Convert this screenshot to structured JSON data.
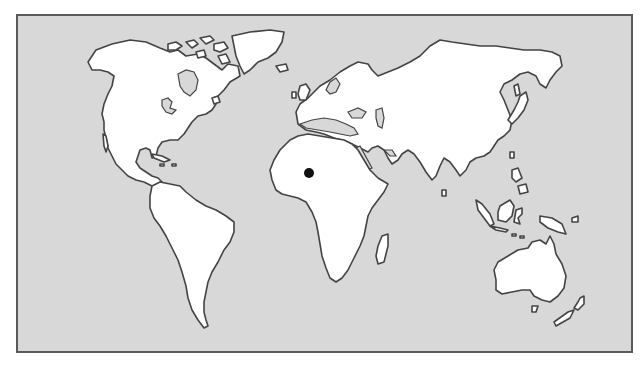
{
  "map": {
    "type": "world-outline",
    "projection": "equirectangular-like",
    "colors": {
      "ocean": "#d8d8d8",
      "land": "#ffffff",
      "coastline": "#444444",
      "frame_border": "#5a5a5a",
      "marker": "#111111"
    },
    "frame": {
      "x": 16,
      "y": 14,
      "width": 615,
      "height": 337
    },
    "marker": {
      "name": "location-marker",
      "region": "West Africa",
      "x": 309,
      "y": 173,
      "radius": 5
    },
    "landmasses": [
      "North America",
      "Greenland",
      "South America",
      "Europe",
      "Africa",
      "Asia",
      "Australia",
      "Madagascar",
      "New Zealand",
      "Japan",
      "Indonesia",
      "New Guinea",
      "Arctic islands",
      "Caribbean islands",
      "British Isles",
      "Iceland"
    ]
  }
}
